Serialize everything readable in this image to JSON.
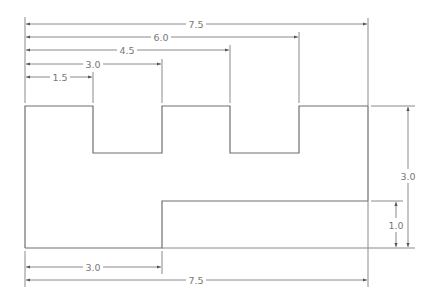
{
  "drawing": {
    "type": "dimensioned technical drawing",
    "units": "in",
    "colors": {
      "line": "#6e6e6e",
      "dimension": "#8a8a8a",
      "text": "#777777",
      "background": "#ffffff"
    },
    "profile": {
      "description": "Stepped part with two rectangular notches on top and a step on the bottom-right",
      "overall_width": 7.5,
      "overall_height": 3.0
    },
    "dimensions": {
      "top": [
        {
          "id": "d-1-5",
          "label": "1.5"
        },
        {
          "id": "d-3-0",
          "label": "3.0"
        },
        {
          "id": "d-4-5",
          "label": "4.5"
        },
        {
          "id": "d-6-0",
          "label": "6.0"
        },
        {
          "id": "d-7-5",
          "label": "7.5"
        }
      ],
      "bottom": [
        {
          "id": "d-bottom-3-0",
          "label": "3.0"
        },
        {
          "id": "d-bottom-7-5",
          "label": "7.5"
        }
      ],
      "right": [
        {
          "id": "d-right-3-0",
          "label": "3.0"
        },
        {
          "id": "d-right-1-0",
          "label": "1.0"
        }
      ]
    }
  }
}
